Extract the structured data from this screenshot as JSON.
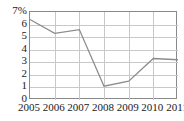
{
  "chart_data": {
    "type": "line",
    "title": "",
    "xlabel": "",
    "ylabel": "",
    "categories": [
      "2005",
      "2006",
      "2007",
      "2008",
      "2009",
      "2010",
      "2011"
    ],
    "values": [
      6.4,
      5.3,
      5.6,
      1.1,
      1.5,
      3.3,
      3.2
    ],
    "series": [
      {
        "name": "",
        "values": [
          6.4,
          5.3,
          5.6,
          1.1,
          1.5,
          3.3,
          3.2
        ]
      }
    ],
    "ylim": [
      0,
      7
    ],
    "xlim": [
      "2005",
      "2011"
    ],
    "y_ticks": [
      "0",
      "1",
      "2",
      "3",
      "4",
      "5",
      "6",
      "7%"
    ],
    "y_tick_values": [
      0,
      1,
      2,
      3,
      4,
      5,
      6,
      7
    ],
    "y_unit": "%",
    "x_ticks": [
      "2005",
      "2006",
      "2007",
      "2008",
      "2009",
      "2010",
      "2011"
    ],
    "grid": true,
    "legend": "none",
    "line_color": "#8c8c8c",
    "grid_color": "#c8c8c8",
    "axis_color": "#8a8a8a",
    "text_color": "#1a1a1a",
    "background": "#ffffff"
  }
}
